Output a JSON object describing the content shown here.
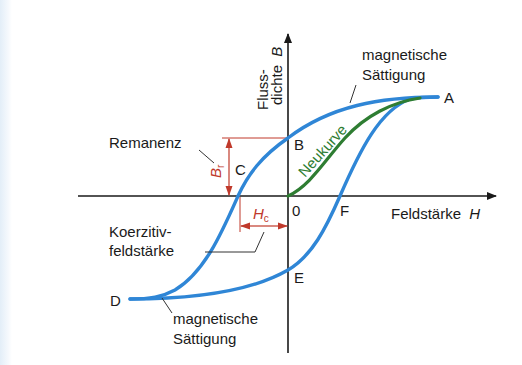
{
  "diagram": {
    "type": "hysteresis-loop",
    "colors": {
      "loop": "#2f86d6",
      "new_curve": "#2e7d32",
      "annotation": "#c0392b",
      "axis": "#1a1a1a",
      "background_edge": "#e3eef8"
    },
    "axes": {
      "y_label_line1": "Fluss-",
      "y_label_line2": "dichte",
      "y_symbol": "B",
      "x_label": "Feldstärke",
      "x_symbol": "H",
      "origin": "0"
    },
    "points": {
      "A": "A",
      "B": "B",
      "C": "C",
      "D": "D",
      "E": "E",
      "F": "F"
    },
    "labels": {
      "saturation_top_line1": "magnetische",
      "saturation_top_line2": "Sättigung",
      "saturation_bottom_line1": "magnetische",
      "saturation_bottom_line2": "Sättigung",
      "remanence": "Remanenz",
      "coercive_line1": "Koerzitiv-",
      "coercive_line2": "feldstärke",
      "new_curve": "Neukurve",
      "br_symbol": "B",
      "br_sub": "r",
      "hc_symbol": "H",
      "hc_sub": "c"
    }
  }
}
